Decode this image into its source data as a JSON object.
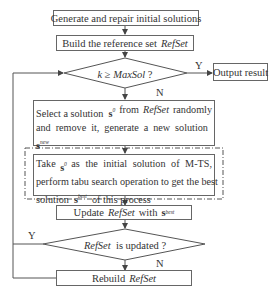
{
  "flowchart": {
    "nodes": {
      "generate": {
        "label": "Generate and repair initial solutions"
      },
      "build": {
        "prefix": "Build the reference set",
        "refset": "RefSet"
      },
      "decision_k": {
        "k": "k",
        "op": "≥",
        "maxsol": "MaxSol",
        "q": "?"
      },
      "output": {
        "label": "Output result"
      },
      "select": {
        "line1_a": "Select a solution",
        "s": "s",
        "s_sup": "0",
        "line1_b": "from",
        "refset": "RefSet",
        "line1_c": "randomly",
        "line2_a": "and remove it, generate a new solution",
        "s2": "s",
        "s2_sup": "new",
        "line3_a": "and add it to",
        "refset2": "RefSet"
      },
      "tabu": {
        "line1_a": "Take",
        "s": "s",
        "s_sup": "0",
        "line1_b": "as the initial solution of M-TS,",
        "line2": "perform tabu search operation to get the best",
        "line3_a": "solution",
        "s2": "s",
        "s2_sup": "best",
        "line3_b": "of this process"
      },
      "update": {
        "a": "Update",
        "refset": "RefSet",
        "b": "with",
        "s": "s",
        "s_sup": "best"
      },
      "decision_updated": {
        "refset": "RefSet",
        "text": "is updated ?"
      },
      "rebuild": {
        "a": "Rebuild",
        "refset": "RefSet"
      }
    },
    "edge_labels": {
      "k_yes": "Y",
      "k_no": "N",
      "updated_yes": "Y",
      "updated_no": "N"
    },
    "colors": {
      "line": "#555555",
      "text": "#333333",
      "background": "#ffffff"
    }
  }
}
